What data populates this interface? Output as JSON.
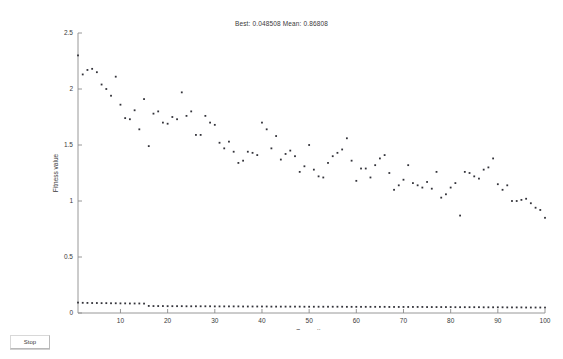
{
  "window": {
    "title": "Best: 0.048508 Mean: 0.86808"
  },
  "toolbar": {
    "stop_label": "Stop"
  },
  "chart_data": {
    "type": "scatter",
    "title": "Best: 0.048508 Mean: 0.86808",
    "xlabel": "Generation",
    "ylabel": "Fitness value",
    "xlim": [
      1,
      100
    ],
    "ylim": [
      0,
      2.5
    ],
    "xticks": [
      10,
      20,
      30,
      40,
      50,
      60,
      70,
      80,
      90,
      100
    ],
    "yticks": [
      0,
      0.5,
      1,
      1.5,
      2,
      2.5
    ],
    "xticklabels": [
      "10",
      "20",
      "30",
      "40",
      "50",
      "60",
      "70",
      "80",
      "90",
      "100"
    ],
    "yticklabels": [
      "0",
      "0.5",
      "1",
      "1.5",
      "2",
      "2.5"
    ],
    "grid": false,
    "legend": null,
    "marker": "dot",
    "marker_color": "#33333a",
    "axis_color": "#8c8c8c",
    "best_value": 0.048508,
    "mean_value": 0.86808,
    "x": [
      1,
      2,
      3,
      4,
      5,
      6,
      7,
      8,
      9,
      10,
      11,
      12,
      13,
      14,
      15,
      16,
      17,
      18,
      19,
      20,
      21,
      22,
      23,
      24,
      25,
      26,
      27,
      28,
      29,
      30,
      31,
      32,
      33,
      34,
      35,
      36,
      37,
      38,
      39,
      40,
      41,
      42,
      43,
      44,
      45,
      46,
      47,
      48,
      49,
      50,
      51,
      52,
      53,
      54,
      55,
      56,
      57,
      58,
      59,
      60,
      61,
      62,
      63,
      64,
      65,
      66,
      67,
      68,
      69,
      70,
      71,
      72,
      73,
      74,
      75,
      76,
      77,
      78,
      79,
      80,
      81,
      82,
      83,
      84,
      85,
      86,
      87,
      88,
      89,
      90,
      91,
      92,
      93,
      94,
      95,
      96,
      97,
      98,
      99,
      100
    ],
    "series": [
      {
        "name": "Mean fitness",
        "values": [
          2.3,
          2.13,
          2.17,
          2.18,
          2.15,
          2.04,
          2.0,
          1.94,
          2.11,
          1.86,
          1.74,
          1.73,
          1.81,
          1.64,
          1.91,
          1.49,
          1.78,
          1.8,
          1.7,
          1.69,
          1.75,
          1.73,
          1.97,
          1.76,
          1.8,
          1.59,
          1.59,
          1.76,
          1.7,
          1.68,
          1.52,
          1.47,
          1.53,
          1.44,
          1.34,
          1.36,
          1.44,
          1.43,
          1.41,
          1.7,
          1.64,
          1.47,
          1.58,
          1.37,
          1.42,
          1.45,
          1.4,
          1.26,
          1.31,
          1.5,
          1.28,
          1.22,
          1.21,
          1.34,
          1.4,
          1.43,
          1.46,
          1.56,
          1.36,
          1.18,
          1.29,
          1.29,
          1.21,
          1.32,
          1.38,
          1.41,
          1.25,
          1.1,
          1.14,
          1.19,
          1.32,
          1.16,
          1.14,
          1.12,
          1.17,
          1.11,
          1.26,
          1.03,
          1.06,
          1.12,
          1.16,
          0.87,
          1.26,
          1.25,
          1.22,
          1.2,
          1.28,
          1.3,
          1.38,
          1.15,
          1.1,
          1.14,
          1.0,
          1.0,
          1.01,
          1.02,
          0.98,
          0.94,
          0.92,
          0.85
        ]
      },
      {
        "name": "Best fitness",
        "values": [
          0.093,
          0.091,
          0.09,
          0.089,
          0.089,
          0.088,
          0.088,
          0.087,
          0.087,
          0.086,
          0.086,
          0.085,
          0.085,
          0.085,
          0.084,
          0.063,
          0.062,
          0.062,
          0.062,
          0.061,
          0.061,
          0.061,
          0.061,
          0.06,
          0.06,
          0.06,
          0.06,
          0.06,
          0.06,
          0.059,
          0.059,
          0.059,
          0.059,
          0.059,
          0.059,
          0.058,
          0.058,
          0.058,
          0.058,
          0.058,
          0.058,
          0.057,
          0.057,
          0.057,
          0.057,
          0.057,
          0.057,
          0.057,
          0.056,
          0.056,
          0.056,
          0.056,
          0.056,
          0.056,
          0.056,
          0.056,
          0.056,
          0.055,
          0.055,
          0.055,
          0.055,
          0.055,
          0.055,
          0.055,
          0.055,
          0.055,
          0.054,
          0.054,
          0.054,
          0.054,
          0.054,
          0.054,
          0.054,
          0.054,
          0.053,
          0.053,
          0.053,
          0.053,
          0.053,
          0.053,
          0.052,
          0.052,
          0.052,
          0.052,
          0.052,
          0.052,
          0.051,
          0.051,
          0.051,
          0.051,
          0.051,
          0.05,
          0.05,
          0.05,
          0.05,
          0.049,
          0.049,
          0.049,
          0.049,
          0.0485
        ]
      }
    ]
  }
}
